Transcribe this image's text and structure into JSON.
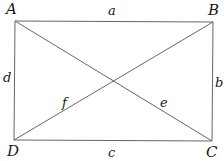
{
  "diagram": {
    "type": "rectangle-with-diagonals",
    "vertices": [
      {
        "id": "A",
        "label": "A",
        "x": 15,
        "y": 21
      },
      {
        "id": "B",
        "label": "B",
        "x": 213,
        "y": 22
      },
      {
        "id": "C",
        "label": "C",
        "x": 212,
        "y": 141
      },
      {
        "id": "D",
        "label": "D",
        "x": 14,
        "y": 140
      }
    ],
    "sides": [
      {
        "from": "A",
        "to": "B",
        "label": "a"
      },
      {
        "from": "B",
        "to": "C",
        "label": "b"
      },
      {
        "from": "D",
        "to": "C",
        "label": "c"
      },
      {
        "from": "A",
        "to": "D",
        "label": "d"
      }
    ],
    "diagonals": [
      {
        "from": "A",
        "to": "C",
        "label": "e"
      },
      {
        "from": "D",
        "to": "B",
        "label": "f"
      }
    ],
    "line_color": "#555555",
    "text_color": "#1a1a1a"
  }
}
